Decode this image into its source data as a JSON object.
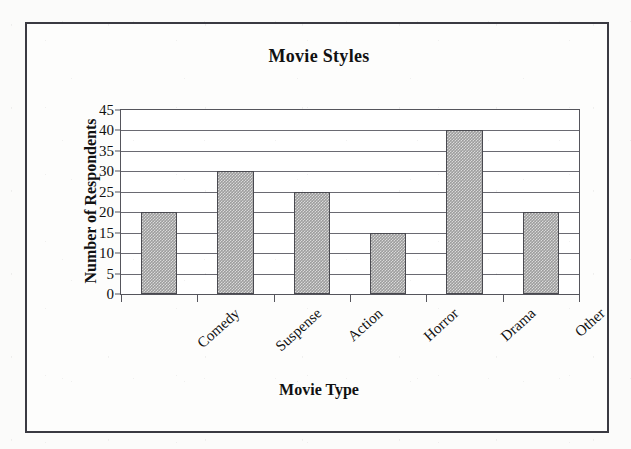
{
  "chart_data": {
    "type": "bar",
    "title": "Movie Styles",
    "xlabel": "Movie Type",
    "ylabel": "Number of Respondents",
    "categories": [
      "Comedy",
      "Suspense",
      "Action",
      "Horror",
      "Drama",
      "Other"
    ],
    "values": [
      20,
      30,
      25,
      15,
      40,
      20
    ],
    "ylim": [
      0,
      45
    ],
    "ytick_step": 5,
    "yticks": [
      0,
      5,
      10,
      15,
      20,
      25,
      30,
      35,
      40,
      45
    ],
    "ytick_labels": [
      "0",
      "5",
      "10",
      "15",
      "20",
      "25",
      "30",
      "35",
      "40",
      "45"
    ],
    "grid": true,
    "grid_axis": "y",
    "legend": false,
    "legend_position": "none",
    "bar_fill_color": "#9d9d9d",
    "bar_border_color": "#4a4a50",
    "axis_color": "#55555c",
    "gridline_color": "#6a6a72",
    "plot_background": "#ffffff",
    "figure_border_color": "#3a3a42",
    "category_label_rotation": -42,
    "series": [
      {
        "name": "Number of Respondents",
        "values": [
          20,
          30,
          25,
          15,
          40,
          20
        ]
      }
    ]
  }
}
